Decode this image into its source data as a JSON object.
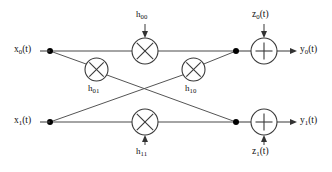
{
  "figure": {
    "name": "mimo-channel-signal-flow-diagram",
    "type": "diagram",
    "width": 332,
    "height": 172,
    "background": "#ffffff",
    "line_color": "#4a4a4a",
    "text_color": "#111111"
  },
  "inputs": [
    {
      "id": "x0",
      "base": "x",
      "sub": "0",
      "suffix": "(t)",
      "x": 16,
      "y": 45
    },
    {
      "id": "x1",
      "base": "x",
      "sub": "1",
      "suffix": "(t)",
      "x": 16,
      "y": 116
    }
  ],
  "outputs": [
    {
      "id": "y0",
      "base": "y",
      "sub": "0",
      "suffix": "(t)",
      "x": 300,
      "y": 45
    },
    {
      "id": "y1",
      "base": "y",
      "sub": "1",
      "suffix": "(t)",
      "x": 300,
      "y": 116
    }
  ],
  "noises": [
    {
      "id": "z0",
      "base": "z",
      "sub": "0",
      "suffix": "(t)",
      "x": 252,
      "y": 10,
      "position": "above"
    },
    {
      "id": "z1",
      "base": "z",
      "sub": "1",
      "suffix": "(t)",
      "x": 252,
      "y": 147,
      "position": "below"
    }
  ],
  "gains": [
    {
      "id": "h00",
      "base": "h",
      "sub": "00",
      "x": 134,
      "y": 10,
      "position": "above-multiplier"
    },
    {
      "id": "h01",
      "base": "h",
      "sub": "01",
      "x": 86,
      "y": 84,
      "position": "below-multiplier"
    },
    {
      "id": "h10",
      "base": "h",
      "sub": "10",
      "x": 184,
      "y": 84,
      "position": "below-multiplier"
    },
    {
      "id": "h11",
      "base": "h",
      "sub": "11",
      "x": 134,
      "y": 147,
      "position": "below-multiplier"
    }
  ],
  "multipliers": [
    {
      "id": "mult-h00",
      "glyph": "multiply",
      "cx": 145,
      "cy": 51,
      "r": 13
    },
    {
      "id": "mult-h01",
      "glyph": "multiply",
      "cx": 96.5,
      "cy": 69.5,
      "r": 11.5
    },
    {
      "id": "mult-h10",
      "glyph": "multiply",
      "cx": 193.5,
      "cy": 69.5,
      "r": 11.5
    },
    {
      "id": "mult-h11",
      "glyph": "multiply",
      "cx": 145,
      "cy": 122,
      "r": 13
    }
  ],
  "adders": [
    {
      "id": "add-y0",
      "glyph": "plus",
      "cx": 264,
      "cy": 51,
      "r": 13
    },
    {
      "id": "add-y1",
      "glyph": "plus",
      "cx": 264,
      "cy": 122,
      "r": 13
    }
  ],
  "junction_dots": [
    {
      "id": "dot-x0-split",
      "cx": 50,
      "cy": 51,
      "r": 3
    },
    {
      "id": "dot-x1-split",
      "cx": 50,
      "cy": 122,
      "r": 3
    },
    {
      "id": "dot-y0-sum",
      "cx": 236,
      "cy": 51,
      "r": 3
    },
    {
      "id": "dot-y1-sum",
      "cx": 236,
      "cy": 122,
      "r": 3
    }
  ],
  "paths": [
    {
      "id": "path-x0-direct",
      "from": "x0",
      "through": "h00",
      "to": "y0",
      "kind": "horizontal"
    },
    {
      "id": "path-x1-direct",
      "from": "x1",
      "through": "h11",
      "to": "y1",
      "kind": "horizontal"
    },
    {
      "id": "path-x0-cross",
      "from": "x0",
      "through": "h01",
      "to": "y1",
      "kind": "diagonal"
    },
    {
      "id": "path-x1-cross",
      "from": "x1",
      "through": "h10",
      "to": "y0",
      "kind": "diagonal"
    }
  ]
}
